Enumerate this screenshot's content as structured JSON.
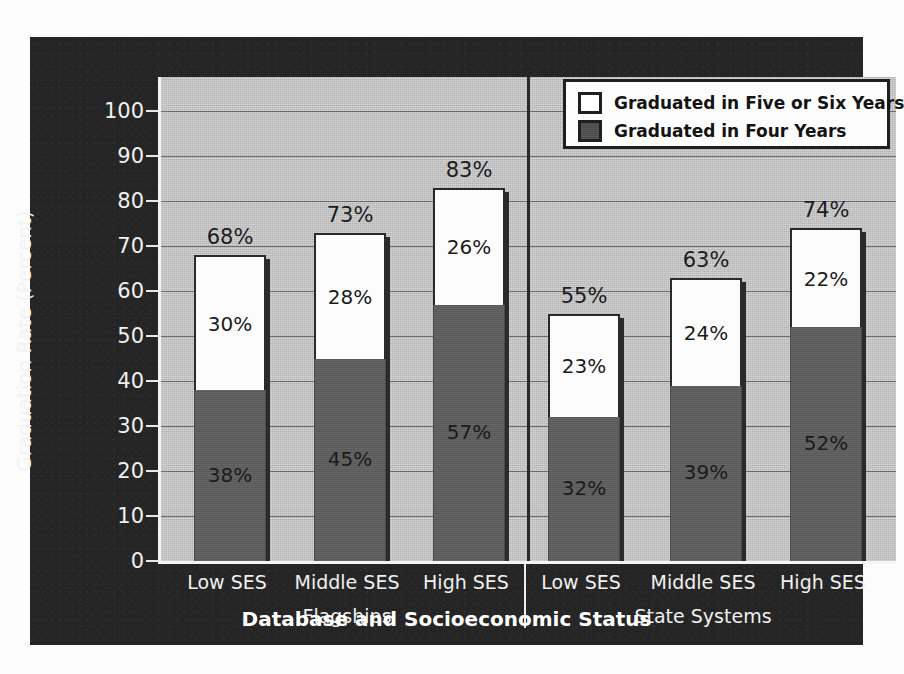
{
  "chart_data": {
    "type": "bar",
    "title": "",
    "xlabel": "Database and Socioeconomic Status",
    "ylabel": "Graduation Rate (Percent)",
    "ylim": [
      0,
      100
    ],
    "ytick_labels": [
      "100",
      "90",
      "80",
      "70",
      "60",
      "50",
      "40",
      "30",
      "20",
      "10",
      "0"
    ],
    "yticks": [
      100,
      90,
      80,
      70,
      60,
      50,
      40,
      30,
      20,
      10,
      0
    ],
    "grid": true,
    "stacked": true,
    "legend_position": "top-right",
    "categories": [
      "Low SES",
      "Middle SES",
      "High SES",
      "Low SES",
      "Middle SES",
      "High SES"
    ],
    "groups": [
      {
        "name": "Flagships",
        "categories": [
          "Low SES",
          "Middle SES",
          "High SES"
        ]
      },
      {
        "name": "State Systems",
        "categories": [
          "Low SES",
          "Middle SES",
          "High SES"
        ]
      }
    ],
    "series": [
      {
        "name": "Graduated in Four Years",
        "color": "#5e5e5e",
        "values": [
          38,
          45,
          57,
          32,
          39,
          52
        ]
      },
      {
        "name": "Graduated in Five or Six Years",
        "color": "#ffffff",
        "values": [
          30,
          28,
          26,
          23,
          24,
          22
        ]
      }
    ],
    "totals": [
      68,
      73,
      83,
      55,
      63,
      74
    ],
    "bars": [
      {
        "group": "Flagships",
        "category": "Low SES",
        "four": 38,
        "fivesix": 30,
        "total": 68,
        "four_label": "38%",
        "fivesix_label": "30%",
        "total_label": "68%"
      },
      {
        "group": "Flagships",
        "category": "Middle SES",
        "four": 45,
        "fivesix": 28,
        "total": 73,
        "four_label": "45%",
        "fivesix_label": "28%",
        "total_label": "73%"
      },
      {
        "group": "Flagships",
        "category": "High SES",
        "four": 57,
        "fivesix": 26,
        "total": 83,
        "four_label": "57%",
        "fivesix_label": "26%",
        "total_label": "83%"
      },
      {
        "group": "State Systems",
        "category": "Low SES",
        "four": 32,
        "fivesix": 23,
        "total": 55,
        "four_label": "32%",
        "fivesix_label": "23%",
        "total_label": "55%"
      },
      {
        "group": "State Systems",
        "category": "Middle SES",
        "four": 39,
        "fivesix": 24,
        "total": 63,
        "four_label": "39%",
        "fivesix_label": "24%",
        "total_label": "63%"
      },
      {
        "group": "State Systems",
        "category": "High SES",
        "four": 52,
        "fivesix": 22,
        "total": 74,
        "four_label": "52%",
        "fivesix_label": "22%",
        "total_label": "74%"
      }
    ],
    "legend": [
      {
        "label": "Graduated in Five or Six Years",
        "swatch": "white"
      },
      {
        "label": "Graduated in Four Years",
        "swatch": "dark"
      }
    ],
    "colors": {
      "panel": "#252525",
      "plot_background": "#c4c4c4",
      "four_years": "#5e5e5e",
      "five_or_six_years": "#ffffff",
      "gridline": "#5c5c5c",
      "axis_text": "#f0f0f0"
    }
  },
  "axis": {
    "y_title": "Graduation Rate (Percent)",
    "x_title": "Database and Socioeconomic Status"
  },
  "legend": {
    "items": [
      {
        "label": "Graduated in Five or Six Years"
      },
      {
        "label": "Graduated in Four Years"
      }
    ]
  }
}
